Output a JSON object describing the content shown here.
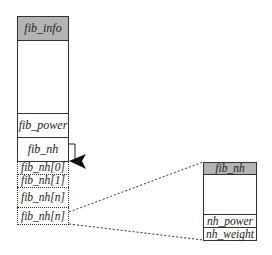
{
  "colors": {
    "header_fill": "#b4b4b4",
    "stroke": "#333333",
    "background": "#ffffff"
  },
  "left_struct": {
    "title": "fib_info",
    "fields": [
      {
        "label": "fib_power",
        "style": "solid"
      },
      {
        "label": "fib_nh",
        "style": "solid"
      }
    ],
    "nh_array": [
      {
        "label": "fib_nh[0]"
      },
      {
        "label": "fib_nh[1]"
      },
      {
        "label": "fib_nh[n]"
      },
      {
        "label": "fib_nh[n]"
      }
    ]
  },
  "right_struct": {
    "title": "fib_nh",
    "fields": [
      {
        "label": "nh_power"
      },
      {
        "label": "nh_weight"
      }
    ]
  },
  "connectors": [
    {
      "from": "fib_nh",
      "to": "fib_nh[0]",
      "type": "arrow",
      "head": "filled-triangle"
    },
    {
      "from": "fib_nh[n]",
      "to": "right_struct.top",
      "type": "dotted-line"
    },
    {
      "from": "fib_nh[n]",
      "to": "right_struct.bottom",
      "type": "dotted-line"
    }
  ]
}
